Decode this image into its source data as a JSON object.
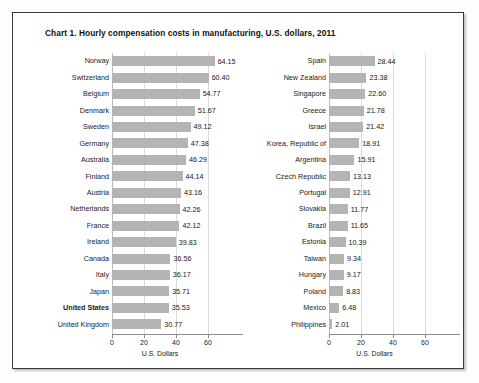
{
  "chart_data": {
    "type": "bar",
    "title": "Chart 1. Hourly compensation costs in manufacturing, U.S. dollars, 2011",
    "orientation": "horizontal",
    "xlabel": "U.S. Dollars",
    "ylabel": "",
    "xlim": [
      0,
      70
    ],
    "xticks": [
      0,
      20,
      40,
      60
    ],
    "grid": true,
    "legend": "none",
    "bar_color": "#b4b4b4",
    "highlighted_category": "United States",
    "panels": [
      {
        "name": "left-panel",
        "categories": [
          "Norway",
          "Switzerland",
          "Belgium",
          "Denmark",
          "Sweden",
          "Germany",
          "Australia",
          "Finland",
          "Austria",
          "Netherlands",
          "France",
          "Ireland",
          "Canada",
          "Italy",
          "Japan",
          "United States",
          "United Kingdom"
        ],
        "values": [
          64.15,
          60.4,
          54.77,
          51.67,
          49.12,
          47.38,
          46.29,
          44.14,
          43.16,
          42.26,
          42.12,
          39.83,
          36.56,
          36.17,
          35.71,
          35.53,
          30.77
        ],
        "xlabel": "U.S. Dollars",
        "xticks": [
          "0",
          "20",
          "40",
          "60"
        ]
      },
      {
        "name": "right-panel",
        "categories": [
          "Spain",
          "New Zealand",
          "Singapore",
          "Greece",
          "Israel",
          "Korea, Republic of",
          "Argentina",
          "Czech Republic",
          "Portugal",
          "Slovakia",
          "Brazil",
          "Estonia",
          "Taiwan",
          "Hungary",
          "Poland",
          "Mexico",
          "Philippines"
        ],
        "values": [
          28.44,
          23.38,
          22.6,
          21.78,
          21.42,
          18.91,
          15.91,
          13.13,
          12.91,
          11.77,
          11.65,
          10.39,
          9.34,
          9.17,
          8.83,
          6.48,
          2.01
        ],
        "xlabel": "U.S. Dollars",
        "xticks": [
          "0",
          "20",
          "40",
          "60"
        ]
      }
    ]
  }
}
